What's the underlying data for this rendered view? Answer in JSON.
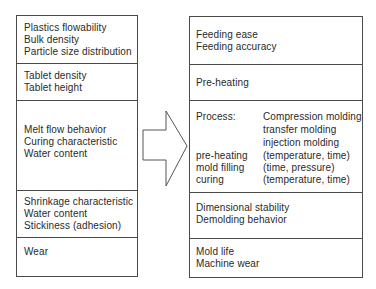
{
  "left_panel": {
    "sections": [
      {
        "lines": [
          "Plastics flowability",
          "Bulk density",
          "Particle size distribution"
        ]
      },
      {
        "lines": [
          "Tablet density",
          "Tablet height"
        ]
      },
      {
        "lines": [
          "Melt flow behavior",
          "Curing characteristic",
          "Water content"
        ]
      },
      {
        "lines": [
          "Shrinkage characteristic",
          "Water content",
          "Stickiness (adhesion)"
        ]
      },
      {
        "lines": [
          "Wear"
        ]
      }
    ]
  },
  "arrow": {
    "direction": "right",
    "icon": "block-arrow-right-icon"
  },
  "right_panel": {
    "sections": [
      {
        "lines": [
          "Feeding ease",
          "Feeding accuracy"
        ]
      },
      {
        "lines": [
          "Pre-heating"
        ]
      },
      {
        "process": {
          "label": "Process:",
          "methods": [
            "Compression molding",
            "transfer molding",
            "injection molding"
          ],
          "steps": [
            {
              "step": "pre-heating",
              "params": "(temperature, time)"
            },
            {
              "step": "mold filling",
              "params": "(time, pressure)"
            },
            {
              "step": "curing",
              "params": "(temperature, time)"
            }
          ]
        }
      },
      {
        "lines": [
          "Dimensional stability",
          "Demolding behavior"
        ]
      },
      {
        "lines": [
          "Mold life",
          "Machine wear"
        ]
      }
    ]
  },
  "colors": {
    "line": "#4a4a4a",
    "text": "#2a2a2a",
    "background": "#ffffff"
  }
}
